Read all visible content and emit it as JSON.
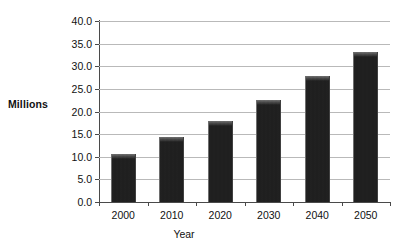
{
  "chart_data": {
    "type": "bar",
    "title": "",
    "xlabel": "Year",
    "ylabel": "Millions",
    "categories": [
      "2000",
      "2010",
      "2020",
      "2030",
      "2040",
      "2050"
    ],
    "values": [
      10.6,
      14.3,
      18.0,
      22.5,
      27.8,
      33.2
    ],
    "series": [
      {
        "name": "Millions",
        "values": [
          10.6,
          14.3,
          18.0,
          22.5,
          27.8,
          33.2
        ]
      }
    ],
    "ylim": [
      0.0,
      40.0
    ],
    "ytick_labels": [
      "0.0",
      "5.0",
      "10.0",
      "15.0",
      "20.0",
      "25.0",
      "30.0",
      "35.0",
      "40.0"
    ],
    "ytick_values": [
      0,
      5,
      10,
      15,
      20,
      25,
      30,
      35,
      40
    ],
    "grid": "horizontal",
    "legend": "none",
    "bar_color": "#585858",
    "gridline_color": "#b9b9b9",
    "axis_color": "#4a4a4a",
    "background_color": "#ffffff"
  }
}
